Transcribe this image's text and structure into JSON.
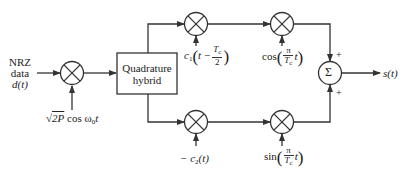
{
  "input": {
    "line1": "NRZ",
    "line2": "data",
    "line3": "d(t)"
  },
  "carrier": {
    "sqrt": "√",
    "term": "2P",
    "func": "cos ω",
    "sub": "0",
    "var": "t"
  },
  "hybrid": {
    "line1": "Quadrature",
    "line2": "hybrid"
  },
  "top_code": {
    "c": "c",
    "sub": "1",
    "t": "t −",
    "num": "T",
    "num_sub": "c",
    "den": "2"
  },
  "bottom_code": {
    "text": "− c",
    "sub": "2",
    "arg": "(t)"
  },
  "top_shaping": {
    "func": "cos",
    "num": "π",
    "den": "T",
    "den_sub": "c",
    "var": "t"
  },
  "bottom_shaping": {
    "func": "sin",
    "num": "π",
    "den": "T",
    "den_sub": "c",
    "var": "t"
  },
  "summer": {
    "symbol": "Σ",
    "plus_top": "+",
    "plus_bottom": "+"
  },
  "output": {
    "label": "s(t)"
  },
  "colors": {
    "line": "#333333",
    "text": "#222222",
    "background": "#ffffff"
  }
}
